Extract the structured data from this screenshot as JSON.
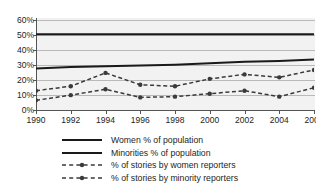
{
  "chart_data": {
    "type": "line",
    "title": "",
    "xlabel": "",
    "ylabel": "",
    "x": [
      1990,
      1992,
      1994,
      1996,
      1998,
      2000,
      2002,
      2004,
      2006
    ],
    "xticklabels": [
      "1990",
      "1992",
      "1994",
      "1996",
      "1998",
      "2000",
      "2002",
      "2004",
      "2006"
    ],
    "yticklabels": [
      "0%",
      "10%",
      "20%",
      "30%",
      "40%",
      "50%",
      "60%"
    ],
    "ytickvalues": [
      0,
      10,
      20,
      30,
      40,
      50,
      60
    ],
    "ylim": [
      0,
      62
    ],
    "xlim": [
      1990,
      2006
    ],
    "grid": true,
    "legend_position": "below",
    "series": [
      {
        "name": "Women % of population",
        "style": "solid",
        "markers": false,
        "color": "#1a1a1a",
        "values": [
          51,
          51,
          51,
          51,
          51,
          51,
          51,
          51,
          51
        ]
      },
      {
        "name": "Minorities % of population",
        "style": "solid",
        "markers": false,
        "color": "#1a1a1a",
        "values": [
          28,
          29,
          29.5,
          30,
          30.5,
          31.5,
          32.5,
          33,
          34
        ]
      },
      {
        "name": "% of stories by women reporters",
        "style": "dashed",
        "markers": true,
        "color": "#3a3a3a",
        "values": [
          13,
          16,
          25,
          17,
          16,
          21,
          24,
          22,
          27
        ]
      },
      {
        "name": "% of stories by minority reporters",
        "style": "dashed",
        "markers": true,
        "color": "#3a3a3a",
        "values": [
          6.5,
          10,
          14,
          8.5,
          9,
          11,
          13,
          9,
          15
        ]
      }
    ]
  },
  "legend": {
    "items": [
      {
        "label": "Women % of population",
        "style": "solid",
        "marker": false
      },
      {
        "label": "Minorities % of population",
        "style": "solid",
        "marker": false
      },
      {
        "label": "% of stories by women reporters",
        "style": "dashed",
        "marker": true
      },
      {
        "label": "% of stories by minority reporters",
        "style": "dashed",
        "marker": true
      }
    ]
  },
  "colors": {
    "plot_background": "#f2f2f2",
    "gridline": "#b9b9b9",
    "axis": "#555555",
    "solid_series": "#1a1a1a",
    "dashed_series": "#3a3a3a",
    "text": "#1d1d1d"
  }
}
